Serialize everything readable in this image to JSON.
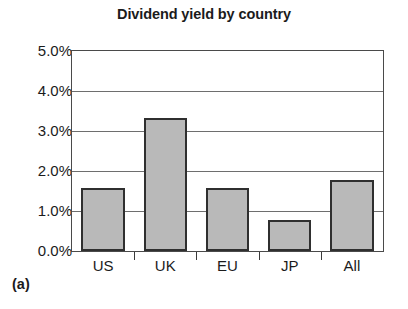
{
  "chart_data": {
    "type": "bar",
    "title": "Dividend yield by country",
    "xlabel": "",
    "ylabel": "",
    "categories": [
      "US",
      "UK",
      "EU",
      "JP",
      "All"
    ],
    "values": [
      1.58,
      3.32,
      1.57,
      0.77,
      1.78
    ],
    "value_labels": [
      "1.58%",
      "3.32%",
      "1.57%",
      "0.77%",
      "1.78%"
    ],
    "ylim": [
      0.0,
      5.0
    ],
    "ytick_values": [
      5.0,
      4.0,
      3.0,
      2.0,
      1.0,
      0.0
    ],
    "ytick_labels": [
      "5.0%",
      "4.0%",
      "3.0%",
      "2.0%",
      "1.0%",
      "0.0%"
    ],
    "grid": "horizontal",
    "legend": "none",
    "bar_fill_color": "#b9b9b9",
    "bar_edge_color": "#2f2f2f",
    "frame_color": "#4a4a4a",
    "gridline_color": "#6e6e6e",
    "background_color": "#ffffff"
  },
  "panel": {
    "label": "(a)"
  }
}
